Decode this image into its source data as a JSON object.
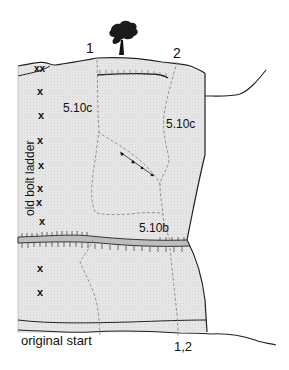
{
  "topo": {
    "route_numbers": {
      "route1_top": "1",
      "route2_top": "2",
      "start": "1,2"
    },
    "grades": {
      "upper_left": "5.10c",
      "upper_right": "5.10c",
      "lower_ledge": "5.10b"
    },
    "annotations": {
      "bolt_ladder": "old bolt ladder",
      "original_start": "original start"
    },
    "bolt_marker": "x",
    "anchor_marker": "xx",
    "colors": {
      "rock_fill": "#e4e4e4",
      "outline": "#222222",
      "route_dash": "#8a8a8a",
      "ledge_fill": "#bdbdbd"
    }
  }
}
